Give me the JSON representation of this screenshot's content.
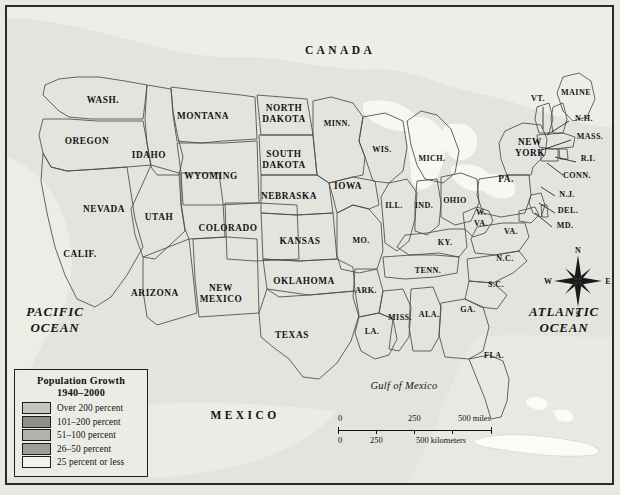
{
  "map": {
    "title": "Population Growth 1940-2000 United States Map",
    "countries": [
      {
        "name": "CANADA",
        "x": 333,
        "y": 47
      },
      {
        "name": "MEXICO",
        "x": 238,
        "y": 412
      }
    ],
    "oceans": [
      {
        "name_line1": "PACIFIC",
        "name_line2": "OCEAN",
        "x": 48,
        "y": 309
      },
      {
        "name_line1": "ATLANTIC",
        "name_line2": "OCEAN",
        "x": 557,
        "y": 309
      }
    ],
    "gulf_label": {
      "name": "Gulf of Mexico",
      "x": 397,
      "y": 382
    }
  },
  "legend": {
    "title_line1": "Population Growth",
    "title_line2": "1940–2000",
    "entries": [
      {
        "label": "Over 200 percent",
        "color": "#c6c6c0",
        "tier": 1
      },
      {
        "label": "101–200 percent",
        "color": "#8f8f8b",
        "tier": 2
      },
      {
        "label": "51–100 percent",
        "color": "#b2b2ac",
        "tier": 3
      },
      {
        "label": "26–50 percent",
        "color": "#9e9e99",
        "tier": 4
      },
      {
        "label": "25 percent or less",
        "color": "#f2f2ee",
        "tier": 5
      }
    ]
  },
  "scalebar": {
    "miles_ticks": [
      "0",
      "250",
      "500 miles"
    ],
    "km_ticks": [
      "0",
      "250",
      "500 kilometers"
    ]
  },
  "compass": {
    "north": "N",
    "east": "E",
    "south": "S",
    "west": "W",
    "x": 571,
    "y": 274
  },
  "states": [
    {
      "id": "WA",
      "label": "WASH.",
      "x": 96,
      "y": 96,
      "tier": 1
    },
    {
      "id": "OR",
      "label": "OREGON",
      "x": 80,
      "y": 137,
      "tier": 1
    },
    {
      "id": "ID",
      "label": "IDAHO",
      "x": 142,
      "y": 151,
      "tier": 1
    },
    {
      "id": "MT",
      "label": "MONTANA",
      "x": 196,
      "y": 112,
      "tier": 2
    },
    {
      "id": "WY",
      "label": "WYOMING",
      "x": 204,
      "y": 172,
      "tier": 2
    },
    {
      "id": "ND",
      "label": "NORTH",
      "label2": "DAKOTA",
      "x": 277,
      "y": 104,
      "tier": 5
    },
    {
      "id": "SD",
      "label": "SOUTH",
      "label2": "DAKOTA",
      "x": 277,
      "y": 150,
      "tier": 5
    },
    {
      "id": "NE",
      "label": "NEBRASKA",
      "x": 282,
      "y": 192,
      "tier": 3
    },
    {
      "id": "NV",
      "label": "NEVADA",
      "x": 97,
      "y": 205,
      "tier": 1
    },
    {
      "id": "UT",
      "label": "UTAH",
      "x": 152,
      "y": 213,
      "tier": 1
    },
    {
      "id": "CO",
      "label": "COLORADO",
      "x": 221,
      "y": 224,
      "tier": 1
    },
    {
      "id": "KS",
      "label": "KANSAS",
      "x": 293,
      "y": 237,
      "tier": 3
    },
    {
      "id": "MO",
      "label": "MO.",
      "x": 354,
      "y": 236,
      "tier": 3
    },
    {
      "id": "IA",
      "label": "IOWA",
      "x": 341,
      "y": 182,
      "tier": 5
    },
    {
      "id": "MN",
      "label": "MINN.",
      "x": 330,
      "y": 119,
      "tier": 4
    },
    {
      "id": "WI",
      "label": "WIS.",
      "x": 375,
      "y": 145,
      "tier": 4
    },
    {
      "id": "IL",
      "label": "ILL.",
      "x": 387,
      "y": 201,
      "tier": 4
    },
    {
      "id": "IN",
      "label": "IND.",
      "x": 417,
      "y": 201,
      "tier": 4
    },
    {
      "id": "MI",
      "label": "MICH.",
      "x": 425,
      "y": 154,
      "tier": 4
    },
    {
      "id": "OH",
      "label": "OHIO",
      "x": 448,
      "y": 196,
      "tier": 4
    },
    {
      "id": "CA",
      "label": "CALIF.",
      "x": 73,
      "y": 250,
      "tier": 1
    },
    {
      "id": "AZ",
      "label": "ARIZONA",
      "x": 148,
      "y": 289,
      "tier": 1
    },
    {
      "id": "NM",
      "label": "NEW",
      "label2": "MEXICO",
      "x": 214,
      "y": 284,
      "tier": 1
    },
    {
      "id": "OK",
      "label": "OKLAHOMA",
      "x": 297,
      "y": 277,
      "tier": 1
    },
    {
      "id": "TX",
      "label": "TEXAS",
      "x": 285,
      "y": 331,
      "tier": 1
    },
    {
      "id": "AR",
      "label": "ARK.",
      "x": 359,
      "y": 286,
      "tier": 3
    },
    {
      "id": "LA",
      "label": "LA.",
      "x": 365,
      "y": 327,
      "tier": 4
    },
    {
      "id": "MS",
      "label": "MISS.",
      "x": 393,
      "y": 313,
      "tier": 3
    },
    {
      "id": "AL",
      "label": "ALA.",
      "x": 422,
      "y": 310,
      "tier": 4
    },
    {
      "id": "TN",
      "label": "TENN.",
      "x": 421,
      "y": 266,
      "tier": 4
    },
    {
      "id": "KY",
      "label": "KY.",
      "x": 438,
      "y": 238,
      "tier": 3
    },
    {
      "id": "GA",
      "label": "GA.",
      "x": 461,
      "y": 305,
      "tier": 1
    },
    {
      "id": "FL",
      "label": "FLA.",
      "x": 487,
      "y": 351,
      "tier": 1
    },
    {
      "id": "SC",
      "label": "S.C.",
      "x": 489,
      "y": 280,
      "tier": 3
    },
    {
      "id": "NC",
      "label": "N.C.",
      "x": 498,
      "y": 254,
      "tier": 3
    },
    {
      "id": "VA",
      "label": "VA.",
      "x": 504,
      "y": 227,
      "tier": 3
    },
    {
      "id": "WV",
      "label": "W.",
      "label2": "VA.",
      "x": 474,
      "y": 208,
      "tier": 5
    },
    {
      "id": "PA",
      "label": "PA.",
      "x": 499,
      "y": 175,
      "tier": 5
    },
    {
      "id": "NY",
      "label": "NEW",
      "label2": "YORK",
      "x": 523,
      "y": 138,
      "tier": 3
    },
    {
      "id": "ME",
      "label": "MAINE",
      "x": 569,
      "y": 88,
      "tier": 3
    },
    {
      "id": "VT",
      "label": "VT.",
      "x": 531,
      "y": 94,
      "tier": 2
    },
    {
      "id": "NH",
      "label": "N.H.",
      "x": 577,
      "y": 114,
      "tier": 3
    },
    {
      "id": "MA",
      "label": "MASS.",
      "x": 583,
      "y": 132,
      "tier": 3
    },
    {
      "id": "RI",
      "label": "R.I.",
      "x": 581,
      "y": 154,
      "tier": 2
    },
    {
      "id": "CT",
      "label": "CONN.",
      "x": 570,
      "y": 171,
      "tier": 3
    },
    {
      "id": "NJ",
      "label": "N.J.",
      "x": 560,
      "y": 190,
      "tier": 3
    },
    {
      "id": "DE",
      "label": "DEL.",
      "x": 561,
      "y": 206,
      "tier": 3
    },
    {
      "id": "MD",
      "label": "MD.",
      "x": 558,
      "y": 221,
      "tier": 3
    }
  ]
}
